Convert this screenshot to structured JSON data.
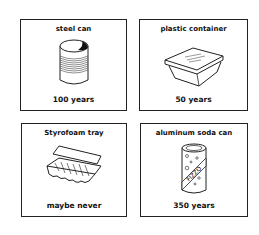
{
  "cards": [
    {
      "title": "steel can",
      "caption": "100 years",
      "icon": "steel-can-icon"
    },
    {
      "title": "plastic container",
      "caption": "50 years",
      "icon": "plastic-container-icon"
    },
    {
      "title": "Styrofoam tray",
      "caption": "maybe never",
      "icon": "egg-carton-icon"
    },
    {
      "title": "aluminum soda can",
      "caption": "350 years",
      "icon": "soda-can-icon",
      "label": "FIZZO"
    }
  ]
}
